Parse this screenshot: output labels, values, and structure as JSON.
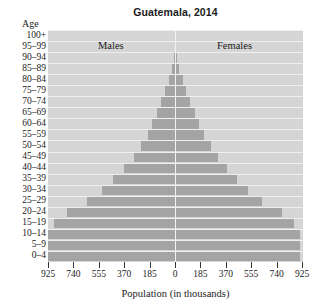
{
  "chart_data": {
    "type": "bar",
    "subtype": "population-pyramid",
    "title": "Guatemala, 2014",
    "xlabel": "Population (in thousands)",
    "ylabel": "Age",
    "legend": [
      "Males",
      "Females"
    ],
    "legend_position": "inside-top",
    "grid": true,
    "xlim": [
      -925,
      925
    ],
    "xticks": [
      -925,
      -740,
      -555,
      -370,
      -185,
      0,
      185,
      370,
      555,
      740,
      925
    ],
    "xticklabels": [
      "925",
      "740",
      "555",
      "370",
      "185",
      "0",
      "185",
      "370",
      "555",
      "740",
      "925"
    ],
    "categories": [
      "0–4",
      "5–9",
      "10–14",
      "15–19",
      "20–24",
      "25–29",
      "30–34",
      "35–39",
      "40–44",
      "45–49",
      "50–54",
      "55–59",
      "60–64",
      "65–69",
      "70–74",
      "75–79",
      "80–84",
      "85–89",
      "90–94",
      "95–99",
      "100+"
    ],
    "series": [
      {
        "name": "Males",
        "values": [
          925,
          925,
          925,
          880,
          790,
          640,
          530,
          450,
          370,
          300,
          250,
          200,
          165,
          130,
          100,
          70,
          45,
          22,
          9,
          2,
          0
        ]
      },
      {
        "name": "Females",
        "values": [
          900,
          900,
          900,
          860,
          770,
          630,
          525,
          445,
          370,
          305,
          255,
          205,
          170,
          135,
          105,
          75,
          48,
          24,
          10,
          2,
          0
        ]
      }
    ]
  },
  "axis": {
    "age_caption": "Age",
    "xtitle": "Population (in thousands)"
  },
  "colors": {
    "plot_background": "#d5d5d5",
    "bar": "#a4a4a4",
    "gridline": "#efefef",
    "center_axis": "#f2f2f2",
    "text": "#1b1b1b"
  }
}
